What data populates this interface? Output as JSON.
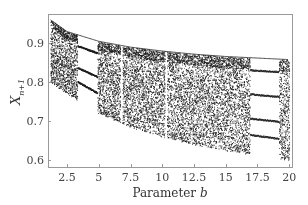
{
  "chart_data": {
    "type": "scatter",
    "subtype": "bifurcation-diagram",
    "title": "",
    "xlabel": "Parameter",
    "xlabel_var": "b",
    "ylabel": "X",
    "ylabel_sub": "n+1",
    "xlim": [
      1.0,
      20.3
    ],
    "ylim": [
      0.58,
      0.975
    ],
    "grid": false,
    "legend": null,
    "x_ticks": [
      2.5,
      5,
      7.5,
      10,
      12.5,
      15,
      17.5,
      20
    ],
    "x_tick_labels": [
      "2.5",
      "5",
      "7.5",
      "10",
      "12.5",
      "15",
      "17.5",
      "20"
    ],
    "y_ticks": [
      0.6,
      0.7,
      0.8,
      0.9
    ],
    "y_tick_labels": [
      "0.6",
      "0.7",
      "0.8",
      "0.9"
    ],
    "envelope": {
      "upper": [
        [
          1.2,
          0.96
        ],
        [
          2.5,
          0.93
        ],
        [
          5,
          0.905
        ],
        [
          7.5,
          0.89
        ],
        [
          10,
          0.88
        ],
        [
          12.5,
          0.872
        ],
        [
          15,
          0.866
        ],
        [
          17.5,
          0.862
        ],
        [
          20,
          0.858
        ]
      ],
      "lower": [
        [
          1.2,
          0.8
        ],
        [
          2.5,
          0.77
        ],
        [
          5,
          0.72
        ],
        [
          7.5,
          0.685
        ],
        [
          10,
          0.66
        ],
        [
          12.5,
          0.64
        ],
        [
          15,
          0.625
        ],
        [
          17.5,
          0.612
        ],
        [
          20,
          0.6
        ]
      ]
    },
    "periodic_windows": [
      {
        "b_range": [
          3.3,
          4.9
        ],
        "branches": 3
      },
      {
        "b_range": [
          6.7,
          6.85
        ],
        "branches": "narrow"
      },
      {
        "b_range": [
          10.2,
          10.35
        ],
        "branches": "narrow"
      },
      {
        "b_range": [
          16.9,
          19.2
        ],
        "branches": 4
      }
    ],
    "point_color": "#1a1a1a"
  }
}
